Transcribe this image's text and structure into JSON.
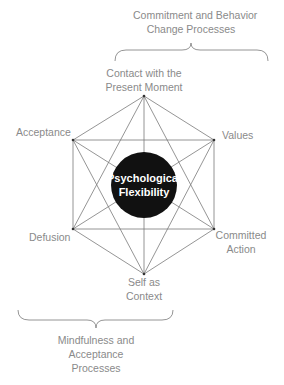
{
  "diagram": {
    "type": "hexaflex",
    "core": {
      "line1": "Psychological",
      "line2": "Flexibility",
      "fill": "#111111"
    },
    "nodes": [
      {
        "id": "contact",
        "line1": "Contact with the",
        "line2": "Present Moment"
      },
      {
        "id": "values",
        "line1": "Values"
      },
      {
        "id": "committed",
        "line1": "Committed",
        "line2": "Action"
      },
      {
        "id": "self",
        "line1": "Self as",
        "line2": "Context"
      },
      {
        "id": "defusion",
        "line1": "Defusion"
      },
      {
        "id": "acceptance",
        "line1": "Acceptance"
      }
    ],
    "groups": {
      "top": {
        "line1": "Commitment and Behavior",
        "line2": "Change Processes"
      },
      "bottom": {
        "line1": "Mindfulness and",
        "line2": "Acceptance",
        "line3": "Processes"
      }
    },
    "colors": {
      "line": "#7a7a7a",
      "label": "#8a8a8a",
      "core": "#111111",
      "core_text": "#ffffff"
    }
  }
}
